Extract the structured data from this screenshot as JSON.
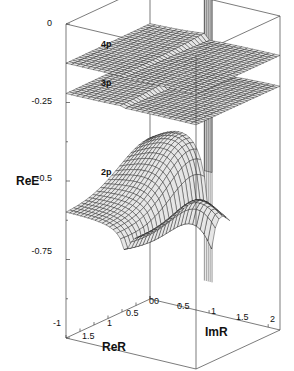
{
  "chart_data": {
    "type": "surface3d",
    "title": "",
    "zlabel": "ReE",
    "xlabel": "ReR",
    "ylabel": "ImR",
    "zticks": [
      "0",
      "-0.25",
      "-0.5",
      "-0.75",
      "-1"
    ],
    "zlim": [
      -1,
      0
    ],
    "xticks": [
      "1.5",
      "1",
      "0.5",
      "0"
    ],
    "xlim": [
      0,
      1.8
    ],
    "yticks": [
      "0",
      "0.5",
      "1",
      "1.5",
      "2"
    ],
    "ylim": [
      0,
      2.2
    ],
    "series": [
      {
        "name": "4p",
        "level": -0.125,
        "description": "thin sheet near ReE=-0.125 with cusp at ImR~1"
      },
      {
        "name": "3p",
        "level": -0.222,
        "description": "sheet near ReE=-0.22, rising to ~-0.2 near ReR~0, cusp at ImR~1"
      },
      {
        "name": "2p",
        "level": -0.5,
        "description": "surface from ~-0.6 at ReR=1.8 down to -1 at ImR~1.2, pole at ImR~1"
      }
    ],
    "colors": {
      "surface_fill": "#e6e6e6",
      "wall_fill": "#d8d8d8",
      "mesh": "#111111",
      "frame": "#444444"
    }
  }
}
